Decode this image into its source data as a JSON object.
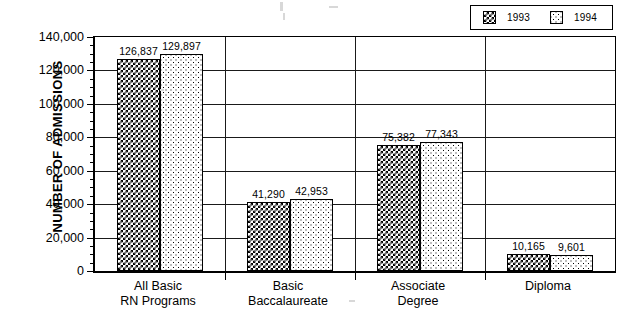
{
  "chart_data": {
    "type": "bar",
    "title": "",
    "subtitle": "",
    "xlabel": "",
    "ylabel": "NUMBER OF ADMISSIONS",
    "categories": [
      "All Basic\nRN Programs",
      "Basic\nBaccalaureate",
      "Associate\nDegree",
      "Diploma"
    ],
    "category_lines": [
      [
        "All Basic",
        "RN Programs"
      ],
      [
        "Basic",
        "Baccalaureate"
      ],
      [
        "Associate",
        "Degree"
      ],
      [
        "Diploma",
        ""
      ]
    ],
    "series": [
      {
        "name": "1993",
        "values": [
          126837,
          129897,
          75382,
          41290
        ],
        "ordered_by_category": false,
        "pattern": "dark-crosshatch",
        "color": "#000000"
      }
    ],
    "series_by_category": [
      {
        "name": "1993",
        "values": [
          126837,
          41290,
          75382,
          10165
        ],
        "pattern": "dark-crosshatch"
      },
      {
        "name": "1994",
        "values": [
          129897,
          42953,
          77343,
          9601
        ],
        "pattern": "light-dots"
      }
    ],
    "value_labels": [
      [
        "126,837",
        "129,897"
      ],
      [
        "41,290",
        "42,953"
      ],
      [
        "75,382",
        "77,343"
      ],
      [
        "10,165",
        "9,601"
      ]
    ],
    "ylim": [
      0,
      140000
    ],
    "ytick_values": [
      0,
      20000,
      40000,
      60000,
      80000,
      100000,
      120000,
      140000
    ],
    "ytick_labels": [
      "0",
      "20,000",
      "40,000",
      "60,000",
      "80,000",
      "100,000",
      "120,000",
      "140,000"
    ],
    "ytick_minor_interval": 5000,
    "grid": "horizontal-and-category-separators",
    "legend_position": "top-right"
  },
  "legend": {
    "entries": [
      {
        "label": "1993",
        "swatch": "dark-crosshatch-swatch"
      },
      {
        "label": "1994",
        "swatch": "light-dots-swatch"
      }
    ]
  }
}
